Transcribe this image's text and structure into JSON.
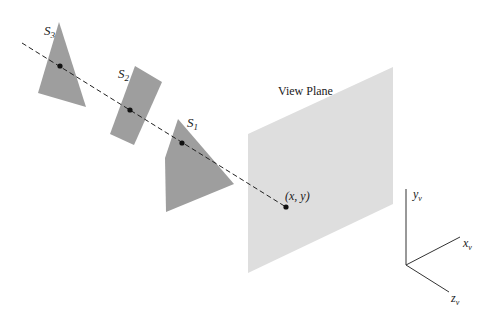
{
  "diagram": {
    "colors": {
      "surface": "#9e9e9e",
      "view_plane": "#dedede",
      "line": "#222222",
      "background": "#ffffff"
    },
    "surfaces": [
      {
        "id": "S3",
        "label_base": "S",
        "label_sub": "3"
      },
      {
        "id": "S2",
        "label_base": "S",
        "label_sub": "2"
      },
      {
        "id": "S1",
        "label_base": "S",
        "label_sub": "1"
      }
    ],
    "view_plane": {
      "label": "View Plane"
    },
    "projection_point": {
      "label": "(x, y)"
    },
    "axes": {
      "y": {
        "base": "y",
        "sub": "v"
      },
      "x": {
        "base": "x",
        "sub": "v"
      },
      "z": {
        "base": "z",
        "sub": "v"
      }
    }
  }
}
